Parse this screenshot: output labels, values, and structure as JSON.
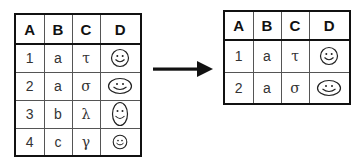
{
  "left_table": {
    "headers": [
      "A",
      "B",
      "C",
      "D"
    ],
    "rows": [
      {
        "A": "1",
        "B": "a",
        "C": "τ",
        "D": "smiley-round"
      },
      {
        "A": "2",
        "B": "a",
        "C": "σ",
        "D": "smiley-wide"
      },
      {
        "A": "3",
        "B": "b",
        "C": "λ",
        "D": "smiley-tall"
      },
      {
        "A": "4",
        "B": "c",
        "C": "γ",
        "D": "smiley-small"
      }
    ]
  },
  "arrow": {
    "icon": "right-arrow-icon",
    "color": "#111111"
  },
  "right_table": {
    "headers": [
      "A",
      "B",
      "C",
      "D"
    ],
    "rows": [
      {
        "A": "1",
        "B": "a",
        "C": "τ",
        "D": "smiley-round"
      },
      {
        "A": "2",
        "B": "a",
        "C": "σ",
        "D": "smiley-wide"
      }
    ]
  },
  "colors": {
    "border": "#111111",
    "inner_border": "#555555",
    "text": "#111111",
    "background": "#ffffff"
  }
}
